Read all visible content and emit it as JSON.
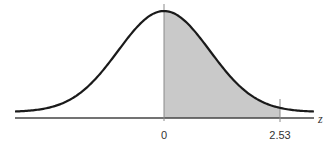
{
  "chart_data": {
    "type": "area",
    "title": "",
    "xlabel": "z",
    "ylabel": "",
    "xlim": [
      -3.25,
      3.27
    ],
    "tick_labels": [
      "0",
      "2.53"
    ],
    "ticks": [
      0,
      2.53
    ],
    "shaded_region": {
      "from": 0,
      "to": 2.53
    },
    "curve": "standard normal density",
    "grid": false,
    "legend": null
  },
  "labels": {
    "tick_zero": "0",
    "tick_bound": "2.53",
    "axis": "z"
  },
  "colors": {
    "curve": "#1a1a1a",
    "axis": "#444444",
    "shade": "#c9c9c9",
    "marker": "#8a8a8a"
  }
}
